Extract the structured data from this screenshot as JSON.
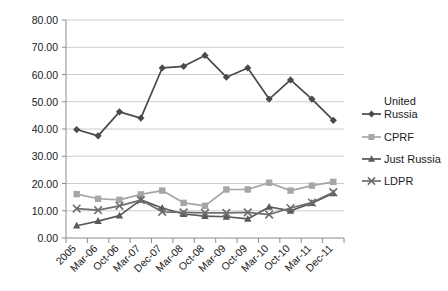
{
  "chart_data": {
    "type": "line",
    "title": "",
    "xlabel": "",
    "ylabel": "",
    "ylim": [
      0,
      80
    ],
    "ytick_step": 10,
    "grid": true,
    "legend_position": "right",
    "ytick_labels": [
      "0.00",
      "10.00",
      "20.00",
      "30.00",
      "40.00",
      "50.00",
      "60.00",
      "70.00",
      "80.00"
    ],
    "categories": [
      "2005",
      "Mar-06",
      "Oct-06",
      "Mar-07",
      "Dec-07",
      "Mar-08",
      "Oct-08",
      "Mar-09",
      "Oct-09",
      "Mar-10",
      "Oct-10",
      "Mar-11",
      "Dec-11"
    ],
    "series": [
      {
        "name": "United Russia",
        "legend_label_line1": "United",
        "legend_label_line2": "Russia",
        "marker": "diamond",
        "color": "#4a4a4a",
        "values": [
          39.8,
          37.5,
          46.3,
          44.0,
          62.4,
          63.0,
          67.0,
          59.0,
          62.4,
          51.0,
          58.0,
          51.0,
          43.2
        ]
      },
      {
        "name": "CPRF",
        "legend_label_line1": "CPRF",
        "legend_label_line2": "",
        "marker": "square",
        "color": "#a6a6a6",
        "values": [
          16.1,
          14.4,
          14.0,
          16.0,
          17.4,
          12.9,
          11.8,
          17.8,
          17.8,
          20.3,
          17.4,
          19.2,
          20.6
        ]
      },
      {
        "name": "Just Russia",
        "legend_label_line1": "Just Russia",
        "legend_label_line2": "",
        "marker": "triangle",
        "color": "#5a5a5a",
        "values": [
          4.5,
          6.2,
          8.2,
          14.0,
          11.0,
          8.8,
          8.0,
          7.8,
          7.0,
          11.4,
          10.0,
          12.8,
          16.4
        ]
      },
      {
        "name": "LDPR",
        "legend_label_line1": "LDPR",
        "legend_label_line2": "",
        "marker": "cross",
        "color": "#6e6e6e",
        "values": [
          10.8,
          10.2,
          11.8,
          13.9,
          9.6,
          9.4,
          9.2,
          9.2,
          9.4,
          8.6,
          11.0,
          13.0,
          16.8
        ]
      }
    ]
  }
}
